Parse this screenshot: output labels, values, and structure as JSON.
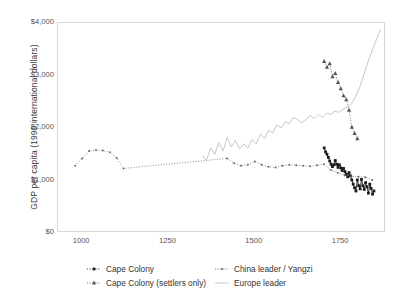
{
  "chart_data": {
    "type": "line",
    "title": "",
    "xlabel": "",
    "ylabel": "GDP per capita (1990 international dollars)",
    "xlim": [
      930,
      1880
    ],
    "ylim": [
      0,
      4000
    ],
    "grid": false,
    "legend_position": "bottom",
    "xticks": [
      1000,
      1250,
      1500,
      1750
    ],
    "xticklabels": [
      "1000",
      "1250",
      "1500",
      "1750"
    ],
    "yticks": [
      0,
      1000,
      2000,
      3000,
      4000
    ],
    "yticklabels": [
      "$0",
      "$1,000",
      "$2,000",
      "$3,000",
      "$4,000"
    ],
    "series": [
      {
        "name": "Cape Colony",
        "color": "#1a1a1a",
        "marker": "square",
        "linestyle": "solid",
        "x": [
          1701,
          1705,
          1709,
          1713,
          1717,
          1721,
          1725,
          1729,
          1733,
          1737,
          1741,
          1745,
          1749,
          1753,
          1757,
          1761,
          1765,
          1769,
          1773,
          1777,
          1781,
          1785,
          1789,
          1793,
          1797,
          1801,
          1805,
          1809,
          1813,
          1817,
          1821,
          1825,
          1829,
          1833,
          1837,
          1841,
          1845
        ],
        "y": [
          1620,
          1545,
          1500,
          1440,
          1370,
          1310,
          1265,
          1300,
          1380,
          1310,
          1250,
          1300,
          1240,
          1190,
          1230,
          1170,
          1120,
          1070,
          1150,
          1090,
          1010,
          930,
          860,
          800,
          1010,
          900,
          840,
          1020,
          900,
          830,
          960,
          880,
          760,
          930,
          850,
          740,
          800
        ]
      },
      {
        "name": "Cape Colony (settlers only)",
        "color": "#555555",
        "marker": "triangle",
        "linestyle": "dotted",
        "x": [
          1701,
          1709,
          1717,
          1725,
          1733,
          1741,
          1749,
          1757,
          1765,
          1773,
          1781,
          1789,
          1797
        ],
        "y": [
          3270,
          3160,
          3230,
          2980,
          3040,
          2870,
          2750,
          2620,
          2540,
          2340,
          2020,
          1900,
          1800
        ]
      },
      {
        "name": "China leader / Yangzi",
        "color": "#6a6a6a",
        "marker": "dot",
        "linestyle": "dotted",
        "x": [
          980,
          1000,
          1020,
          1040,
          1060,
          1080,
          1100,
          1120,
          1420,
          1440,
          1460,
          1480,
          1500,
          1520,
          1540,
          1560,
          1580,
          1600,
          1620,
          1640,
          1660,
          1680,
          1700,
          1720,
          1740,
          1760,
          1780,
          1800,
          1820,
          1840
        ],
        "y": [
          1280,
          1420,
          1560,
          1580,
          1570,
          1540,
          1430,
          1230,
          1420,
          1330,
          1280,
          1300,
          1360,
          1300,
          1260,
          1250,
          1280,
          1300,
          1290,
          1280,
          1270,
          1290,
          1310,
          1200,
          1150,
          1100,
          1080,
          1070,
          1060,
          1010
        ]
      },
      {
        "name": "Europe leader",
        "color": "#b9b9b9",
        "marker": "none",
        "linestyle": "solid",
        "x": [
          1348,
          1360,
          1372,
          1384,
          1396,
          1408,
          1420,
          1432,
          1444,
          1456,
          1468,
          1480,
          1492,
          1504,
          1516,
          1528,
          1540,
          1552,
          1564,
          1576,
          1588,
          1600,
          1612,
          1624,
          1636,
          1648,
          1660,
          1672,
          1684,
          1696,
          1708,
          1720,
          1732,
          1744,
          1756,
          1768,
          1780,
          1792,
          1804,
          1816,
          1828,
          1840,
          1852,
          1864
        ],
        "y": [
          1480,
          1380,
          1620,
          1500,
          1720,
          1560,
          1820,
          1640,
          1760,
          1600,
          1700,
          1620,
          1780,
          1700,
          1880,
          1800,
          1960,
          1900,
          2060,
          2000,
          2120,
          2080,
          2200,
          2160,
          2100,
          2160,
          2240,
          2180,
          2260,
          2200,
          2280,
          2260,
          2320,
          2300,
          2360,
          2400,
          2460,
          2600,
          2780,
          3020,
          3260,
          3480,
          3680,
          3880
        ]
      }
    ]
  },
  "legend": {
    "items": [
      {
        "label": "Cape Colony",
        "marker": "square-line",
        "color": "#1a1a1a"
      },
      {
        "label": "Cape Colony (settlers only)",
        "marker": "triangle-line",
        "color": "#555555"
      },
      {
        "label": "China leader / Yangzi",
        "marker": "dot-line",
        "color": "#6a6a6a"
      },
      {
        "label": "Europe leader",
        "marker": "plain-line",
        "color": "#b9b9b9"
      }
    ]
  }
}
